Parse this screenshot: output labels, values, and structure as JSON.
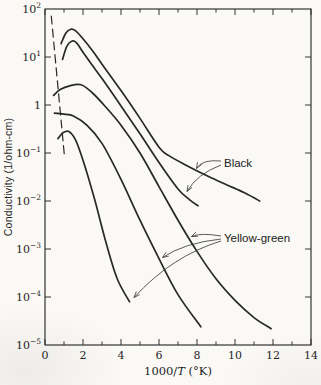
{
  "chart_data": {
    "type": "line",
    "title": "",
    "xlabel": "1000/T (°K)",
    "ylabel": "Conductivity (1/ohm-cm)",
    "x_range": [
      0,
      14
    ],
    "x_major_ticks": [
      0,
      2,
      4,
      6,
      8,
      10,
      12,
      14
    ],
    "x_minor_tick_step": 1,
    "y_scale": "log",
    "y_exponent_range": [
      -5,
      2
    ],
    "y_tick_labels": [
      "10^2",
      "10^1",
      "1",
      "10^−1",
      "10^−2",
      "10^−3",
      "10^−4",
      "10^−5"
    ],
    "grid": false,
    "legend_position": "none",
    "series": [
      {
        "name": "black-upper",
        "group": "Black",
        "style": "solid",
        "x": [
          0.85,
          1.1,
          1.35,
          1.6,
          2.0,
          2.5,
          3.0,
          4.0,
          5.0,
          6.0,
          6.5,
          7.5,
          8.5,
          9.5,
          10.5,
          11.3
        ],
        "log10_y": [
          1.28,
          1.5,
          1.58,
          1.55,
          1.38,
          1.13,
          0.85,
          0.3,
          -0.28,
          -0.88,
          -1.05,
          -1.27,
          -1.47,
          -1.65,
          -1.83,
          -2.0
        ]
      },
      {
        "name": "black-lower",
        "group": "Black",
        "style": "solid",
        "x": [
          0.92,
          1.15,
          1.4,
          1.65,
          2.0,
          2.5,
          3.0,
          4.0,
          5.0,
          6.0,
          7.0,
          7.6,
          8.05
        ],
        "log10_y": [
          0.95,
          1.22,
          1.33,
          1.3,
          1.1,
          0.82,
          0.55,
          -0.02,
          -0.6,
          -1.2,
          -1.75,
          -1.97,
          -2.1
        ]
      },
      {
        "name": "yellow-green-upper",
        "group": "Yellow-green",
        "style": "solid",
        "x": [
          0.45,
          0.8,
          1.3,
          1.9,
          2.5,
          3.1,
          4.0,
          5.0,
          6.0,
          7.0,
          8.0,
          9.0,
          10.0,
          11.0,
          11.9
        ],
        "log10_y": [
          0.2,
          0.32,
          0.4,
          0.42,
          0.25,
          0.0,
          -0.42,
          -1.0,
          -1.7,
          -2.4,
          -3.05,
          -3.62,
          -4.07,
          -4.43,
          -4.66
        ]
      },
      {
        "name": "yellow-green-middle",
        "group": "Yellow-green",
        "style": "solid",
        "x": [
          0.5,
          1.0,
          1.5,
          2.2,
          3.0,
          4.0,
          5.0,
          6.0,
          7.0,
          8.2
        ],
        "log10_y": [
          -0.17,
          -0.19,
          -0.23,
          -0.42,
          -0.8,
          -1.55,
          -2.4,
          -3.2,
          -3.95,
          -4.62
        ]
      },
      {
        "name": "yellow-green-steep",
        "group": "Yellow-green",
        "style": "solid",
        "x": [
          0.68,
          0.95,
          1.25,
          1.6,
          2.0,
          2.6,
          3.2,
          3.8,
          4.45
        ],
        "log10_y": [
          -0.7,
          -0.58,
          -0.55,
          -0.72,
          -1.15,
          -1.95,
          -2.85,
          -3.62,
          -4.1
        ]
      },
      {
        "name": "dashed-reference",
        "group": "reference",
        "style": "dashed",
        "x": [
          0.33,
          1.03
        ],
        "log10_y": [
          1.85,
          -1.1
        ]
      }
    ],
    "annotations": [
      {
        "text": "Black",
        "points_to": [
          "black-upper",
          "black-lower"
        ]
      },
      {
        "text": "Yellow-green",
        "points_to": [
          "yellow-green-upper",
          "yellow-green-middle",
          "yellow-green-steep"
        ]
      }
    ]
  }
}
